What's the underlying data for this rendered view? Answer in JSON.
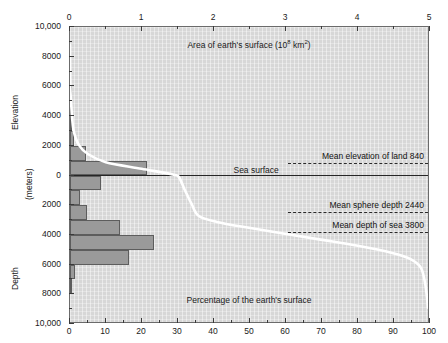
{
  "figure": {
    "title_top": "Area of earth's surface  (10",
    "title_top_exp": "8",
    "title_top_tail": "  km",
    "title_top_exp2": "2",
    "title_top_close": ")",
    "title_bottom": "Percentage of the earth's surface",
    "sea_surface_label": "Sea surface",
    "y_axis_upper_label": "Elevation",
    "y_axis_lower_label": "Depth",
    "y_axis_units_label": "(meters)",
    "colors": {
      "plot_bg": "#d7d7d7",
      "bar_fill": "#9a9a9a",
      "bar_stroke": "#5d5d5d",
      "curve": "#ffffff",
      "axis": "#3a3a3a",
      "sea_line": "#262626",
      "text": "#1a1a1a"
    }
  },
  "annotations": [
    {
      "label": "Mean elevation of land 840",
      "value": 840,
      "y_m": 840
    },
    {
      "label": "Mean sphere depth 2440",
      "value": 2440,
      "y_m": -2440
    },
    {
      "label": "Mean depth of sea 3800",
      "value": 3800,
      "y_m": -3800
    }
  ],
  "chart_data": {
    "type": "area",
    "xlabel_top": "Area of earth's surface (10^8 km^2)",
    "xlabel_bottom": "Percentage of the earth's surface",
    "ylabel": "Elevation / Depth (meters)",
    "ylim": [
      -10000,
      10000
    ],
    "y_direction": "elevation up, depth down",
    "grid": true,
    "legend_position": "none",
    "axis_top": {
      "label": "Area of earth's surface (10^8 km^2)",
      "ticks": [
        0,
        1,
        2,
        3,
        4,
        5
      ],
      "tick_labels": [
        "0",
        "1",
        "2",
        "3",
        "4",
        "5"
      ],
      "range": [
        0,
        5
      ],
      "minor_ticks": [
        0.5,
        1.5,
        2.5,
        3.5,
        4.5
      ]
    },
    "axis_bottom": {
      "label": "Percentage of the earth's surface",
      "ticks": [
        0,
        10,
        20,
        30,
        40,
        50,
        60,
        70,
        80,
        90,
        100
      ],
      "tick_labels": [
        "0",
        "10",
        "20",
        "30",
        "40",
        "50",
        "60",
        "70",
        "80",
        "90",
        "100"
      ],
      "range": [
        0,
        100
      ],
      "minor_ticks": [
        5,
        15,
        25,
        35,
        45,
        55,
        65,
        75,
        85,
        95
      ]
    },
    "axis_left": {
      "label_upper": "Elevation",
      "label_lower": "Depth",
      "units": "(meters)",
      "ticks": [
        10000,
        8000,
        6000,
        4000,
        2000,
        0,
        -2000,
        -4000,
        -6000,
        -8000,
        -10000
      ],
      "tick_labels": [
        "10,000",
        "8000",
        "6000",
        "4000",
        "2000",
        "0",
        "2000",
        "4000",
        "6000",
        "8000",
        "10,000"
      ],
      "minor_ticks": [
        9000,
        7000,
        5000,
        3000,
        1000,
        -1000,
        -3000,
        -5000,
        -7000,
        -9000
      ],
      "range": [
        -10000,
        10000
      ]
    },
    "histogram": {
      "description": "Frequency distribution of earth's surface area by 1000 m elevation/depth interval, as percentage of earth's surface",
      "bin_size_m": 1000,
      "units": "percent of earth's surface",
      "bins": [
        {
          "top_m": 6000,
          "bottom_m": 5000,
          "percent": 0.2
        },
        {
          "top_m": 5000,
          "bottom_m": 4000,
          "percent": 0.4
        },
        {
          "top_m": 4000,
          "bottom_m": 3000,
          "percent": 0.6
        },
        {
          "top_m": 3000,
          "bottom_m": 2000,
          "percent": 1.1
        },
        {
          "top_m": 2000,
          "bottom_m": 1000,
          "percent": 4.5
        },
        {
          "top_m": 1000,
          "bottom_m": 0,
          "percent": 21.3
        },
        {
          "top_m": 0,
          "bottom_m": -1000,
          "percent": 8.5
        },
        {
          "top_m": -1000,
          "bottom_m": -2000,
          "percent": 2.9
        },
        {
          "top_m": -2000,
          "bottom_m": -3000,
          "percent": 4.7
        },
        {
          "top_m": -3000,
          "bottom_m": -4000,
          "percent": 13.9
        },
        {
          "top_m": -4000,
          "bottom_m": -5000,
          "percent": 23.3
        },
        {
          "top_m": -5000,
          "bottom_m": -6000,
          "percent": 16.4
        },
        {
          "top_m": -6000,
          "bottom_m": -7000,
          "percent": 1.5
        },
        {
          "top_m": -7000,
          "bottom_m": -8000,
          "percent": 0.3
        }
      ]
    },
    "hypsographic_curve": {
      "description": "Cumulative percentage of earth's surface at or above a given elevation",
      "x_units": "cumulative percent of earth's surface",
      "y_units": "meters",
      "points": [
        {
          "percent": 0.0,
          "elevation_m": 8800
        },
        {
          "percent": 0.1,
          "elevation_m": 6000
        },
        {
          "percent": 0.4,
          "elevation_m": 4500
        },
        {
          "percent": 1.0,
          "elevation_m": 3000
        },
        {
          "percent": 2.5,
          "elevation_m": 2000
        },
        {
          "percent": 5.0,
          "elevation_m": 1400
        },
        {
          "percent": 10.0,
          "elevation_m": 840
        },
        {
          "percent": 20.0,
          "elevation_m": 400
        },
        {
          "percent": 29.0,
          "elevation_m": 0
        },
        {
          "percent": 30.5,
          "elevation_m": -200
        },
        {
          "percent": 32.0,
          "elevation_m": -1000
        },
        {
          "percent": 34.0,
          "elevation_m": -2000
        },
        {
          "percent": 36.0,
          "elevation_m": -2800
        },
        {
          "percent": 41.0,
          "elevation_m": -3200
        },
        {
          "percent": 50.0,
          "elevation_m": -3600
        },
        {
          "percent": 60.0,
          "elevation_m": -4000
        },
        {
          "percent": 70.0,
          "elevation_m": -4400
        },
        {
          "percent": 80.0,
          "elevation_m": -4800
        },
        {
          "percent": 90.0,
          "elevation_m": -5300
        },
        {
          "percent": 95.0,
          "elevation_m": -5700
        },
        {
          "percent": 98.0,
          "elevation_m": -6300
        },
        {
          "percent": 99.3,
          "elevation_m": -7500
        },
        {
          "percent": 100.0,
          "elevation_m": -9000
        }
      ]
    }
  }
}
